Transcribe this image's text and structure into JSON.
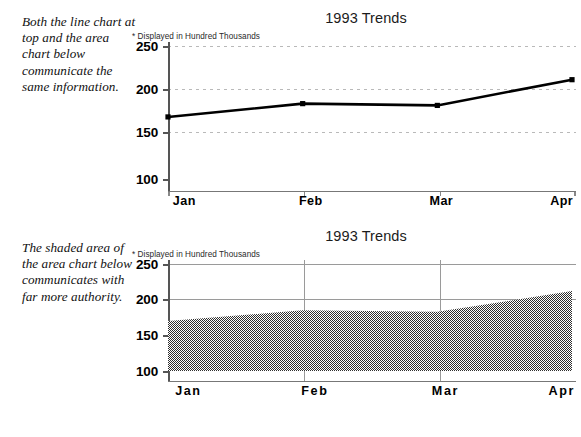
{
  "captions": {
    "first": "Both the line chart at top and the area chart below communicate the same information.",
    "second": "The shaded area of the area chart below communicates with far more authority."
  },
  "charts": [
    {
      "id": "line-chart",
      "title": "1993 Trends",
      "subtitle": "* Displayed in Hundred Thousands"
    },
    {
      "id": "area-chart",
      "title": "1993 Trends",
      "subtitle": "* Displayed in Hundred Thousands"
    }
  ],
  "chart_data": [
    {
      "type": "line",
      "title": "1993 Trends",
      "subtitle": "* Displayed in Hundred Thousands",
      "categories": [
        "Jan",
        "Feb",
        "Mar",
        "Apr"
      ],
      "values": [
        170,
        185,
        183,
        212
      ],
      "xlabel": "",
      "ylabel": "",
      "ylim": [
        100,
        250
      ],
      "yticks": [
        100,
        150,
        200,
        250
      ],
      "ytick_labels": [
        "100",
        "150",
        "200",
        "250"
      ],
      "grid": "horizontal-dotted",
      "legend": "none",
      "marker": "square",
      "line_color": "#000000",
      "marker_color": "#000000"
    },
    {
      "type": "area",
      "title": "1993 Trends",
      "subtitle": "* Displayed in Hundred Thousands",
      "categories": [
        "Jan",
        "Feb",
        "Mar",
        "Apr"
      ],
      "values": [
        170,
        185,
        183,
        212
      ],
      "xlabel": "",
      "ylabel": "",
      "ylim": [
        100,
        250
      ],
      "yticks": [
        100,
        150,
        200,
        250
      ],
      "ytick_labels": [
        "100",
        "150",
        "200",
        "250"
      ],
      "grid": "solid-both",
      "legend": "none",
      "fill": "50-percent-gray-checker",
      "fill_color": "#5a5a5a"
    }
  ]
}
